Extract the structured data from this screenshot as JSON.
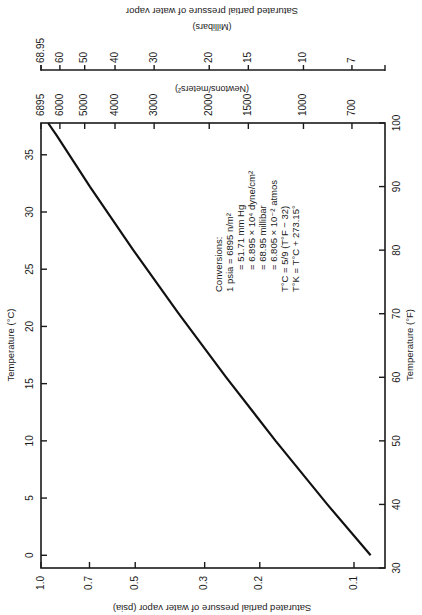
{
  "chart_data": {
    "type": "line",
    "orientation_note": "figure printed rotated 90 degrees clockwise",
    "axes": {
      "temperature_c": {
        "label": "Temperature (°C)",
        "ticks": [
          0,
          5,
          10,
          15,
          20,
          25,
          30,
          35
        ],
        "range": [
          0,
          37.78
        ]
      },
      "temperature_f": {
        "label": "Temperature (°F)",
        "ticks": [
          30,
          40,
          50,
          60,
          70,
          80,
          90,
          100
        ],
        "range": [
          30,
          100
        ]
      },
      "pressure_psia": {
        "label": "Saturated partial pressure of water vapor (psia)",
        "ticks": [
          1.0,
          0.7,
          0.5,
          0.3,
          0.2,
          0.1
        ],
        "scale": "log",
        "range": [
          0.075,
          1.0
        ]
      },
      "pressure_nm2": {
        "label": "(Newtons/meters²)",
        "ticks": [
          6895,
          6000,
          5000,
          4000,
          3000,
          2000,
          1500,
          1000,
          700
        ],
        "scale": "log"
      },
      "pressure_mbar": {
        "label_1": "Saturated partial pressure of water vapor",
        "label_2": "(Millibars)",
        "ticks": [
          "68.95",
          "60",
          "50",
          "40",
          "30",
          "20",
          "15",
          "10",
          "7"
        ],
        "scale": "log"
      }
    },
    "series": [
      {
        "name": "Saturated vapor pressure",
        "x_temperature_f": [
          32,
          40,
          50,
          60,
          70,
          80,
          90,
          98
        ],
        "y_pressure_psia": [
          0.0885,
          0.1217,
          0.178,
          0.256,
          0.363,
          0.507,
          0.698,
          0.89
        ]
      }
    ],
    "annotation": {
      "heading": "Conversions:",
      "lines": [
        "1 psia = 6895 n/m²",
        "= 51.71 mm Hg",
        "= 6.895 × 10⁴ dyne/cm²",
        "= 68.95 millibar",
        "= 6.805 × 10⁻² atmos",
        "T°C    = 5/9 (T°F − 32)",
        "T°K    = T°C + 273.15°"
      ]
    }
  }
}
